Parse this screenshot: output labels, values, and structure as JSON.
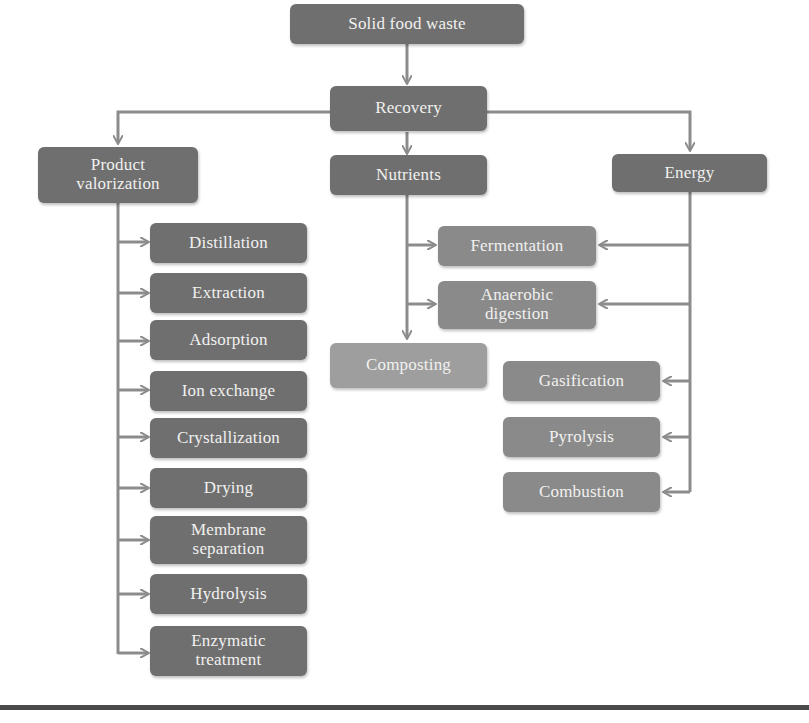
{
  "diagram": {
    "root": {
      "label": "Solid food waste"
    },
    "recovery": {
      "label": "Recovery"
    },
    "branches": {
      "product_valorization": {
        "label": "Product valorization",
        "line1": "Product",
        "line2": "valorization",
        "children": [
          "Distillation",
          "Extraction",
          "Adsorption",
          "Ion exchange",
          "Crystallization",
          "Drying",
          [
            "Membrane",
            "separation"
          ],
          "Hydrolysis",
          [
            "Enzymatic",
            "treatment"
          ]
        ]
      },
      "nutrients": {
        "label": "Nutrients",
        "shared_children": [
          "Fermentation",
          [
            "Anaerobic",
            "digestion"
          ]
        ],
        "children": [
          "Composting"
        ]
      },
      "energy": {
        "label": "Energy",
        "shared_children": [
          "Fermentation",
          [
            "Anaerobic",
            "digestion"
          ]
        ],
        "children": [
          "Gasification",
          "Pyrolysis",
          "Combustion"
        ]
      }
    },
    "colors": {
      "dark_box": "#6f6f6f",
      "medium_box": "#8a8a8a",
      "light_box": "#9e9e9e",
      "connector": "#8c8c8c",
      "text": "#f1f1ef"
    }
  },
  "labels": {
    "root": "Solid food waste",
    "recovery": "Recovery",
    "pv_1": "Product",
    "pv_2": "valorization",
    "nutrients": "Nutrients",
    "energy": "Energy",
    "distillation": "Distillation",
    "extraction": "Extraction",
    "adsorption": "Adsorption",
    "ion_exchange": "Ion exchange",
    "crystallization": "Crystallization",
    "drying": "Drying",
    "membrane_1": "Membrane",
    "membrane_2": "separation",
    "hydrolysis": "Hydrolysis",
    "enzymatic_1": "Enzymatic",
    "enzymatic_2": "treatment",
    "fermentation": "Fermentation",
    "anaerobic_1": "Anaerobic",
    "anaerobic_2": "digestion",
    "composting": "Composting",
    "gasification": "Gasification",
    "pyrolysis": "Pyrolysis",
    "combustion": "Combustion"
  }
}
